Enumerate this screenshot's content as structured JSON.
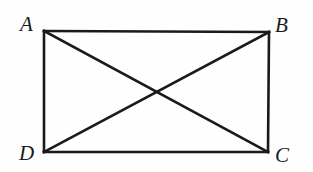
{
  "figure": {
    "kind": "geometry-diagram",
    "background_color": "#fefefe",
    "stroke_color": "#1a1a1a",
    "label_color": "#1a1a1a",
    "canvas": {
      "width": 313,
      "height": 172
    },
    "rectangle": {
      "name": "ABCD",
      "stroke_width": 2.6,
      "top_left": {
        "x": 44,
        "y": 31
      },
      "top_right": {
        "x": 269,
        "y": 32
      },
      "bottom_right": {
        "x": 268,
        "y": 152
      },
      "bottom_left": {
        "x": 44,
        "y": 152
      }
    },
    "diagonals": [
      {
        "name": "AC",
        "from": "A",
        "to": "C",
        "stroke_width": 2.6,
        "x1": 44,
        "y1": 31,
        "x2": 268,
        "y2": 152
      },
      {
        "name": "BD",
        "from": "B",
        "to": "D",
        "stroke_width": 2.6,
        "x1": 269,
        "y1": 32,
        "x2": 44,
        "y2": 152
      }
    ],
    "intersection": {
      "name": "diagonal-intersection",
      "x": 156,
      "y": 92
    },
    "vertices": [
      {
        "id": "A",
        "label": "A",
        "position": "top-left",
        "point_x": 44,
        "point_y": 31
      },
      {
        "id": "B",
        "label": "B",
        "position": "top-right",
        "point_x": 269,
        "point_y": 32
      },
      {
        "id": "C",
        "label": "C",
        "position": "bottom-right",
        "point_x": 268,
        "point_y": 152
      },
      {
        "id": "D",
        "label": "D",
        "position": "bottom-left",
        "point_x": 44,
        "point_y": 152
      }
    ]
  }
}
